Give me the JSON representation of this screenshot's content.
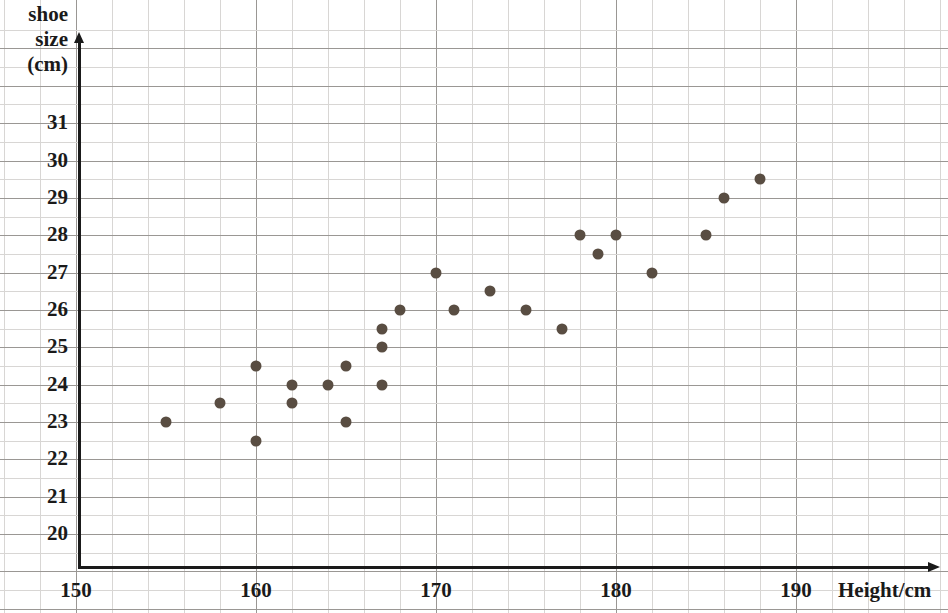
{
  "chart_data": {
    "type": "scatter",
    "title": "",
    "xlabel": "Height/cm",
    "ylabel": "shoe size (cm)",
    "ylabel_lines": [
      "shoe",
      "size",
      "(cm)"
    ],
    "xlim": [
      150,
      192
    ],
    "ylim": [
      19.2,
      31.7
    ],
    "xticks": [
      150,
      160,
      170,
      180,
      190
    ],
    "yticks": [
      20,
      21,
      22,
      23,
      24,
      25,
      26,
      27,
      28,
      29,
      30,
      31
    ],
    "xtick_labels": [
      "150",
      "160",
      "170",
      "180",
      "190"
    ],
    "ytick_labels": [
      "20",
      "21",
      "22",
      "23",
      "24",
      "25",
      "26",
      "27",
      "28",
      "29",
      "30",
      "31"
    ],
    "x_minor_step": 2,
    "y_minor_step": 0.5,
    "grid": true,
    "legend": "none",
    "marker_color": "#594d42",
    "axis_color": "#1a1a1a",
    "grid_color_major": "#9a9794",
    "grid_color_minor": "#d8d6d4",
    "points": [
      {
        "x": 155,
        "y": 23
      },
      {
        "x": 158,
        "y": 23.5
      },
      {
        "x": 160,
        "y": 24.5
      },
      {
        "x": 160,
        "y": 22.5
      },
      {
        "x": 162,
        "y": 24
      },
      {
        "x": 162,
        "y": 23.5
      },
      {
        "x": 164,
        "y": 24
      },
      {
        "x": 165,
        "y": 24.5
      },
      {
        "x": 165,
        "y": 23
      },
      {
        "x": 167,
        "y": 25.5
      },
      {
        "x": 167,
        "y": 25
      },
      {
        "x": 167,
        "y": 24
      },
      {
        "x": 168,
        "y": 26
      },
      {
        "x": 170,
        "y": 27
      },
      {
        "x": 171,
        "y": 26
      },
      {
        "x": 173,
        "y": 26.5
      },
      {
        "x": 175,
        "y": 26
      },
      {
        "x": 177,
        "y": 25.5
      },
      {
        "x": 178,
        "y": 28
      },
      {
        "x": 179,
        "y": 27.5
      },
      {
        "x": 180,
        "y": 28
      },
      {
        "x": 182,
        "y": 27
      },
      {
        "x": 185,
        "y": 28
      },
      {
        "x": 186,
        "y": 29
      },
      {
        "x": 188,
        "y": 29.5
      }
    ]
  }
}
